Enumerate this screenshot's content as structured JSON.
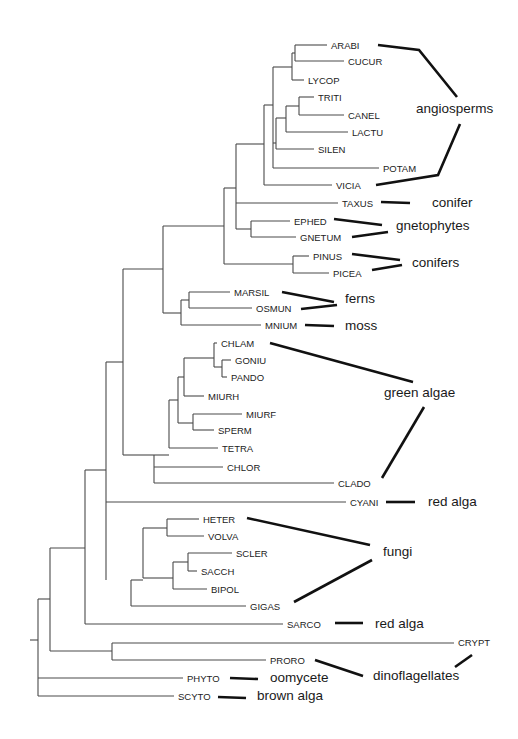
{
  "figure": {
    "type": "phylogenetic tree",
    "taxa": [
      {
        "id": "ARABI",
        "label": "ARABI",
        "x": 331,
        "y": 45
      },
      {
        "id": "CUCUR",
        "label": "CUCUR",
        "x": 348,
        "y": 61
      },
      {
        "id": "LYCOP",
        "label": "LYCOP",
        "x": 308,
        "y": 80
      },
      {
        "id": "TRITI",
        "label": "TRITI",
        "x": 318,
        "y": 97
      },
      {
        "id": "CANEL",
        "label": "CANEL",
        "x": 348,
        "y": 115
      },
      {
        "id": "LACTU",
        "label": "LACTU",
        "x": 352,
        "y": 132
      },
      {
        "id": "SILEN",
        "label": "SILEN",
        "x": 318,
        "y": 149
      },
      {
        "id": "POTAM",
        "label": "POTAM",
        "x": 383,
        "y": 168
      },
      {
        "id": "VICIA",
        "label": "VICIA",
        "x": 336,
        "y": 185
      },
      {
        "id": "TAXUS",
        "label": "TAXUS",
        "x": 342,
        "y": 203
      },
      {
        "id": "EPHED",
        "label": "EPHED",
        "x": 294,
        "y": 221
      },
      {
        "id": "GNETUM",
        "label": "GNETUM",
        "x": 300,
        "y": 237
      },
      {
        "id": "PINUS",
        "label": "PINUS",
        "x": 313,
        "y": 256
      },
      {
        "id": "PICEA",
        "label": "PICEA",
        "x": 333,
        "y": 273
      },
      {
        "id": "MARSIL",
        "label": "MARSIL",
        "x": 234,
        "y": 292
      },
      {
        "id": "OSMUN",
        "label": "OSMUN",
        "x": 256,
        "y": 308
      },
      {
        "id": "MNIUM",
        "label": "MNIUM",
        "x": 265,
        "y": 325
      },
      {
        "id": "CHLAM",
        "label": "CHLAM",
        "x": 221,
        "y": 343
      },
      {
        "id": "GONIU",
        "label": "GONIU",
        "x": 235,
        "y": 360
      },
      {
        "id": "PANDO",
        "label": "PANDO",
        "x": 231,
        "y": 377
      },
      {
        "id": "MIURH",
        "label": "MIURH",
        "x": 208,
        "y": 396
      },
      {
        "id": "MIURF",
        "label": "MIURF",
        "x": 246,
        "y": 414
      },
      {
        "id": "SPERM",
        "label": "SPERM",
        "x": 218,
        "y": 430
      },
      {
        "id": "TETRA",
        "label": "TETRA",
        "x": 222,
        "y": 448
      },
      {
        "id": "CHLOR",
        "label": "CHLOR",
        "x": 227,
        "y": 467
      },
      {
        "id": "CLADO",
        "label": "CLADO",
        "x": 338,
        "y": 483
      },
      {
        "id": "CYANI",
        "label": "CYANI",
        "x": 350,
        "y": 502
      },
      {
        "id": "HETER",
        "label": "HETER",
        "x": 203,
        "y": 519
      },
      {
        "id": "VOLVA",
        "label": "VOLVA",
        "x": 208,
        "y": 536
      },
      {
        "id": "SCLER",
        "label": "SCLER",
        "x": 236,
        "y": 553
      },
      {
        "id": "SACCH",
        "label": "SACCH",
        "x": 201,
        "y": 571
      },
      {
        "id": "BIPOL",
        "label": "BIPOL",
        "x": 211,
        "y": 589
      },
      {
        "id": "GIGAS",
        "label": "GIGAS",
        "x": 250,
        "y": 606
      },
      {
        "id": "SARCO",
        "label": "SARCO",
        "x": 287,
        "y": 624
      },
      {
        "id": "CRYPT",
        "label": "CRYPT",
        "x": 458,
        "y": 642
      },
      {
        "id": "PRORO",
        "label": "PRORO",
        "x": 270,
        "y": 660
      },
      {
        "id": "PHYTO",
        "label": "PHYTO",
        "x": 187,
        "y": 678
      },
      {
        "id": "SCYTO",
        "label": "SCYTO",
        "x": 178,
        "y": 696
      }
    ],
    "branches": [
      "M295,45 H327",
      "M295,61 H344",
      "M295,45 V61",
      "M292,53 H295",
      "M292,80 H304",
      "M292,53 V80",
      "M299,97 H314",
      "M299,115 H344",
      "M299,97 V115",
      "M286,106 H299",
      "M286,132 H348",
      "M286,106 V132",
      "M276,118 H286",
      "M276,149 H314",
      "M276,118 V149",
      "M273,67 H292",
      "M273,143 H276",
      "M273,168 H379",
      "M273,67 V168",
      "M264,105 H273",
      "M264,185 H332",
      "M264,105 V185",
      "M236,144 H264",
      "M236,203 H338",
      "M251,221 H290",
      "M251,237 H296",
      "M251,221 V237",
      "M236,229 H251",
      "M236,144 V229",
      "M293,256 H309",
      "M293,273 H329",
      "M293,256 V273",
      "M224,188 H236",
      "M224,264 H293",
      "M224,188 V264",
      "M189,292 H230",
      "M189,308 H252",
      "M189,292 V308",
      "M181,300 H189",
      "M181,325 H261",
      "M181,300 V325",
      "M163,226 H224",
      "M163,313 H181",
      "M163,226 V313",
      "M222,360 H231",
      "M222,377 H227",
      "M222,360 V377",
      "M214,343 H217",
      "M214,367 H222",
      "M214,343 V367",
      "M184,358 H214",
      "M184,396 H204",
      "M184,358 V396",
      "M193,414 H242",
      "M193,430 H214",
      "M193,414 V430",
      "M178,377 H184",
      "M178,423 H193",
      "M178,377 V423",
      "M169,400 H178",
      "M169,448 H218",
      "M169,400 V448",
      "M154,455 H169",
      "M154,467 H223",
      "M154,483 H334",
      "M154,455 V483",
      "M123,269 H163",
      "M123,455 H154",
      "M123,269 V455",
      "M106,362 H123",
      "M106,502 H346",
      "M167,519 H199",
      "M167,536 H204",
      "M167,519 V536",
      "M188,553 H232",
      "M188,571 H197",
      "M188,553 V571",
      "M173,562 H188",
      "M173,589 H207",
      "M173,562 V589",
      "M143,528 H167",
      "M143,578 H173",
      "M143,528 V578",
      "M131,580 H143",
      "M131,606 H246",
      "M131,580 V606",
      "M106,362 V580",
      "M85,470 H106",
      "M85,624 H283",
      "M85,470 V624",
      "M112,643 H454",
      "M112,660 H266",
      "M112,643 V660",
      "M50,548 H85",
      "M50,651 H112",
      "M50,548 V651",
      "M38,599 H50",
      "M38,678 H183",
      "M38,696 H174",
      "M38,599 V696",
      "M30,640 H38"
    ],
    "groups": [
      {
        "id": "angiosperms",
        "label": "angiosperms",
        "x": 416,
        "y": 113,
        "lines": [
          "M378,45 L419,50 L457,97",
          "M460,124 L438,175 L376,185"
        ]
      },
      {
        "id": "conifer-taxus",
        "label": "conifer",
        "x": 432,
        "y": 207,
        "lines": [
          "M381,202 L410,203"
        ]
      },
      {
        "id": "gnetophytes",
        "label": "gnetophytes",
        "x": 396,
        "y": 230,
        "lines": [
          "M334,219 L382,225",
          "M352,237 L388,232"
        ]
      },
      {
        "id": "conifers",
        "label": "conifers",
        "x": 412,
        "y": 267,
        "lines": [
          "M352,254 L400,260",
          "M372,270 L402,265"
        ]
      },
      {
        "id": "ferns",
        "label": "ferns",
        "x": 345,
        "y": 303,
        "lines": [
          "M282,292 L334,302",
          "M301,309 L337,305"
        ]
      },
      {
        "id": "moss",
        "label": "moss",
        "x": 345,
        "y": 330,
        "lines": [
          "M305,325 L334,326"
        ]
      },
      {
        "id": "green-algae",
        "label": "green algae",
        "x": 384,
        "y": 397,
        "lines": [
          "M270,343 L413,382",
          "M424,407 L382,478"
        ]
      },
      {
        "id": "red-alga-cyani",
        "label": "red alga",
        "x": 428,
        "y": 506,
        "lines": [
          "M386,502 L415,502"
        ]
      },
      {
        "id": "fungi",
        "label": "fungi",
        "x": 383,
        "y": 556,
        "lines": [
          "M247,518 L370,545",
          "M372,560 L294,602"
        ]
      },
      {
        "id": "red-alga-sarco",
        "label": "red alga",
        "x": 375,
        "y": 628,
        "lines": [
          "M335,623 L363,623"
        ]
      },
      {
        "id": "dinoflagellates",
        "label": "dinoflagellates",
        "x": 373,
        "y": 680,
        "lines": [
          "M315,660 L363,676",
          "M472,655 L455,667"
        ]
      },
      {
        "id": "oomycete",
        "label": "oomycete",
        "x": 270,
        "y": 682,
        "lines": [
          "M230,678 L258,679"
        ]
      },
      {
        "id": "brown-alga",
        "label": "brown alga",
        "x": 257,
        "y": 700,
        "lines": [
          "M218,697 L246,698"
        ]
      }
    ]
  }
}
